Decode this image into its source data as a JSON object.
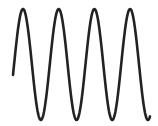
{
  "figure": {
    "stroke_color": "#222222",
    "background": "#ffffff",
    "stroke_width": 2.6
  },
  "wave": {
    "x_start": 13,
    "x_end": 150,
    "center_y": 64.5,
    "amplitude": 55.5,
    "period": 35.7,
    "phase_x_first_peak": 23,
    "peaks_x": [
      23,
      58,
      94,
      130
    ],
    "troughs_x": [
      39,
      74,
      110,
      146
    ]
  }
}
